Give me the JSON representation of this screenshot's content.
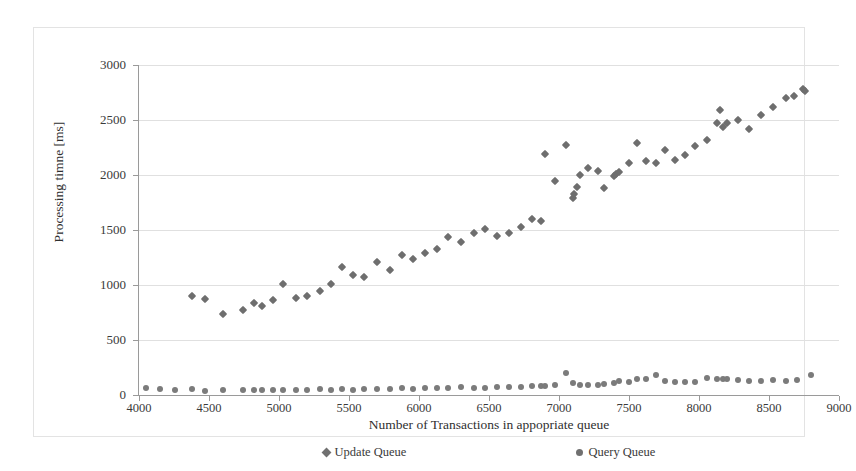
{
  "chart_data": {
    "type": "scatter",
    "title": "",
    "xlabel": "Number of Transactions in appopriate queue",
    "ylabel": "Processing timne [ms]",
    "xlim": [
      4000,
      9000
    ],
    "ylim": [
      0,
      3000
    ],
    "xticks": [
      4000,
      4500,
      5000,
      5500,
      6000,
      6500,
      7000,
      7500,
      8000,
      8500,
      9000
    ],
    "yticks": [
      0,
      500,
      1000,
      1500,
      2000,
      2500,
      3000
    ],
    "grid": "horizontal",
    "legend_position": "bottom",
    "marker_color": "#6e6e6e",
    "gridline_color": "#e0e0e0",
    "axis_color": "#9a9a9a",
    "series": [
      {
        "name": "Update Queue",
        "marker": "diamond",
        "color": "#6e6e6e",
        "points": [
          [
            4380,
            900
          ],
          [
            4470,
            870
          ],
          [
            4600,
            735
          ],
          [
            4740,
            775
          ],
          [
            4820,
            835
          ],
          [
            4880,
            805
          ],
          [
            4960,
            865
          ],
          [
            5030,
            1010
          ],
          [
            5120,
            880
          ],
          [
            5200,
            900
          ],
          [
            5290,
            950
          ],
          [
            5370,
            1010
          ],
          [
            5450,
            1160
          ],
          [
            5530,
            1095
          ],
          [
            5610,
            1075
          ],
          [
            5700,
            1210
          ],
          [
            5790,
            1140
          ],
          [
            5880,
            1270
          ],
          [
            5960,
            1235
          ],
          [
            6040,
            1290
          ],
          [
            6130,
            1325
          ],
          [
            6210,
            1440
          ],
          [
            6300,
            1390
          ],
          [
            6390,
            1470
          ],
          [
            6470,
            1510
          ],
          [
            6560,
            1450
          ],
          [
            6640,
            1470
          ],
          [
            6730,
            1525
          ],
          [
            6810,
            1600
          ],
          [
            6870,
            1580
          ],
          [
            6900,
            2190
          ],
          [
            6970,
            1945
          ],
          [
            7050,
            2275
          ],
          [
            7100,
            1790
          ],
          [
            7110,
            1830
          ],
          [
            7130,
            1890
          ],
          [
            7150,
            2000
          ],
          [
            7210,
            2060
          ],
          [
            7280,
            2040
          ],
          [
            7320,
            1885
          ],
          [
            7390,
            1990
          ],
          [
            7410,
            2010
          ],
          [
            7430,
            2030
          ],
          [
            7500,
            2105
          ],
          [
            7560,
            2290
          ],
          [
            7620,
            2130
          ],
          [
            7690,
            2105
          ],
          [
            7760,
            2230
          ],
          [
            7830,
            2140
          ],
          [
            7900,
            2180
          ],
          [
            7970,
            2260
          ],
          [
            8060,
            2320
          ],
          [
            8130,
            2470
          ],
          [
            8150,
            2590
          ],
          [
            8170,
            2440
          ],
          [
            8200,
            2470
          ],
          [
            8280,
            2500
          ],
          [
            8360,
            2420
          ],
          [
            8440,
            2545
          ],
          [
            8530,
            2620
          ],
          [
            8620,
            2700
          ],
          [
            8680,
            2720
          ],
          [
            8740,
            2780
          ],
          [
            8760,
            2760
          ]
        ]
      },
      {
        "name": "Query Queue",
        "marker": "circle",
        "color": "#7b7b7b",
        "points": [
          [
            4050,
            65
          ],
          [
            4150,
            55
          ],
          [
            4260,
            50
          ],
          [
            4380,
            55
          ],
          [
            4470,
            40
          ],
          [
            4600,
            45
          ],
          [
            4740,
            42
          ],
          [
            4820,
            50
          ],
          [
            4880,
            48
          ],
          [
            4960,
            45
          ],
          [
            5030,
            48
          ],
          [
            5120,
            44
          ],
          [
            5200,
            50
          ],
          [
            5290,
            52
          ],
          [
            5370,
            48
          ],
          [
            5450,
            55
          ],
          [
            5530,
            50
          ],
          [
            5610,
            55
          ],
          [
            5700,
            58
          ],
          [
            5790,
            55
          ],
          [
            5880,
            60
          ],
          [
            5960,
            58
          ],
          [
            6040,
            62
          ],
          [
            6130,
            65
          ],
          [
            6210,
            60
          ],
          [
            6300,
            70
          ],
          [
            6390,
            65
          ],
          [
            6470,
            68
          ],
          [
            6560,
            70
          ],
          [
            6640,
            72
          ],
          [
            6730,
            75
          ],
          [
            6810,
            80
          ],
          [
            6870,
            85
          ],
          [
            6900,
            78
          ],
          [
            6970,
            95
          ],
          [
            7050,
            200
          ],
          [
            7100,
            110
          ],
          [
            7150,
            90
          ],
          [
            7210,
            95
          ],
          [
            7280,
            92
          ],
          [
            7320,
            100
          ],
          [
            7390,
            105
          ],
          [
            7430,
            128
          ],
          [
            7500,
            118
          ],
          [
            7560,
            148
          ],
          [
            7620,
            145
          ],
          [
            7690,
            178
          ],
          [
            7760,
            130
          ],
          [
            7830,
            118
          ],
          [
            7900,
            122
          ],
          [
            7970,
            120
          ],
          [
            8060,
            152
          ],
          [
            8130,
            148
          ],
          [
            8170,
            150
          ],
          [
            8200,
            145
          ],
          [
            8280,
            138
          ],
          [
            8360,
            128
          ],
          [
            8440,
            130
          ],
          [
            8530,
            132
          ],
          [
            8620,
            128
          ],
          [
            8700,
            135
          ],
          [
            8800,
            185
          ]
        ]
      }
    ]
  },
  "legend": {
    "entries": [
      {
        "label": "Update Queue",
        "marker": "diamond"
      },
      {
        "label": "Query Queue",
        "marker": "circle"
      }
    ]
  }
}
